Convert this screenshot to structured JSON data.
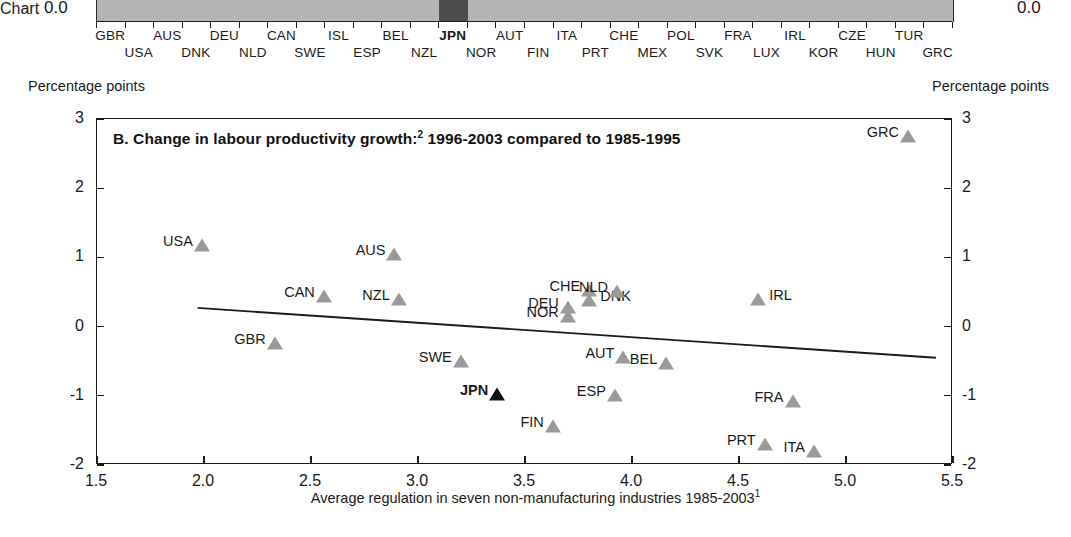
{
  "panel_a": {
    "axis_label_left": "0.0",
    "axis_label_right": "0.0",
    "highlight_country": "JPN",
    "bar_color": "#b4b4b4",
    "highlight_color": "#4c4c4c",
    "row1": [
      "GBR",
      "AUS",
      "DEU",
      "CAN",
      "ISL",
      "BEL",
      "JPN",
      "AUT",
      "ITA",
      "CHE",
      "POL",
      "FRA",
      "IRL",
      "CZE",
      "TUR"
    ],
    "row2": [
      "USA",
      "DNK",
      "NLD",
      "SWE",
      "ESP",
      "NZL",
      "NOR",
      "FIN",
      "PRT",
      "MEX",
      "SVK",
      "LUX",
      "KOR",
      "HUN",
      "GRC"
    ],
    "order": [
      "GBR",
      "USA",
      "AUS",
      "DNK",
      "DEU",
      "NLD",
      "CAN",
      "SWE",
      "ISL",
      "ESP",
      "BEL",
      "NZL",
      "JPN",
      "NOR",
      "AUT",
      "FIN",
      "ITA",
      "PRT",
      "CHE",
      "MEX",
      "POL",
      "SVK",
      "FRA",
      "LUX",
      "IRL",
      "KOR",
      "CZE",
      "HUN",
      "TUR",
      "GRC"
    ]
  },
  "chart_data": {
    "type": "scatter",
    "title": "B. Change in labour productivity growth:",
    "title_sup": "2",
    "title_rest": " 1996-2003 compared to 1985-1995",
    "unit_left": "Percentage points",
    "unit_right": "Percentage points",
    "xlabel": "Average regulation in seven non-manufacturing industries 1985-2003",
    "xlabel_sup": "1",
    "ylabel": "Percentage points",
    "xlim": [
      1.5,
      5.5
    ],
    "ylim": [
      -2,
      3
    ],
    "xticks": [
      1.5,
      2.0,
      2.5,
      3.0,
      3.5,
      4.0,
      4.5,
      5.0,
      5.5
    ],
    "xticklabels": [
      "1.5",
      "2.0",
      "2.5",
      "3.0",
      "3.5",
      "4.0",
      "4.5",
      "5.0",
      "5.5"
    ],
    "yticks": [
      -2,
      -1,
      0,
      1,
      2,
      3
    ],
    "yticklabels": [
      "-2",
      "-1",
      "0",
      "1",
      "2",
      "3"
    ],
    "grid": false,
    "legend": null,
    "marker_color": "#9a9a9a",
    "highlight_marker_color": "#111111",
    "trendline": {
      "x0": 1.97,
      "y0": 0.27,
      "x1": 5.42,
      "y1": -0.45
    },
    "points": [
      {
        "label": "USA",
        "x": 1.99,
        "y": 1.15,
        "side": "left"
      },
      {
        "label": "GBR",
        "x": 2.33,
        "y": -0.26,
        "side": "left"
      },
      {
        "label": "CAN",
        "x": 2.56,
        "y": 0.42,
        "side": "left"
      },
      {
        "label": "AUS",
        "x": 2.89,
        "y": 1.02,
        "side": "left"
      },
      {
        "label": "NZL",
        "x": 2.91,
        "y": 0.37,
        "side": "left"
      },
      {
        "label": "SWE",
        "x": 3.2,
        "y": -0.52,
        "side": "left"
      },
      {
        "label": "JPN",
        "x": 3.37,
        "y": -1.0,
        "side": "left",
        "highlight": true
      },
      {
        "label": "FIN",
        "x": 3.63,
        "y": -1.47,
        "side": "left"
      },
      {
        "label": "DEU",
        "x": 3.7,
        "y": 0.25,
        "side": "left"
      },
      {
        "label": "NOR",
        "x": 3.7,
        "y": 0.12,
        "side": "left"
      },
      {
        "label": "CHE",
        "x": 3.8,
        "y": 0.5,
        "side": "left"
      },
      {
        "label": "DNK",
        "x": 3.8,
        "y": 0.36,
        "side": "right"
      },
      {
        "label": "NLD",
        "x": 3.93,
        "y": 0.48,
        "side": "left"
      },
      {
        "label": "ESP",
        "x": 3.92,
        "y": -1.02,
        "side": "left"
      },
      {
        "label": "AUT",
        "x": 3.96,
        "y": -0.47,
        "side": "left"
      },
      {
        "label": "BEL",
        "x": 4.16,
        "y": -0.56,
        "side": "left"
      },
      {
        "label": "IRL",
        "x": 4.59,
        "y": 0.37,
        "side": "right"
      },
      {
        "label": "PRT",
        "x": 4.62,
        "y": -1.72,
        "side": "left"
      },
      {
        "label": "FRA",
        "x": 4.75,
        "y": -1.1,
        "side": "left"
      },
      {
        "label": "ITA",
        "x": 4.85,
        "y": -1.82,
        "side": "left"
      },
      {
        "label": "GRC",
        "x": 5.29,
        "y": 2.72,
        "side": "left"
      }
    ]
  }
}
